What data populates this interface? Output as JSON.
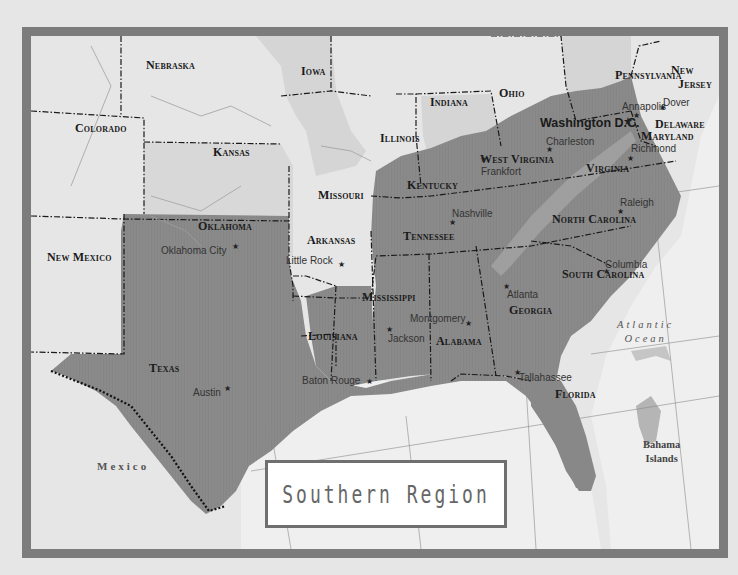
{
  "map": {
    "title": "Southern Region",
    "colors": {
      "frame": "#7c7c7c",
      "background": "#ececec",
      "non_region_state": "#e2e2e2",
      "northern_state_shade": "#d0d0d0",
      "southern_region": "#8a8a8a",
      "water": "#f2f2f2",
      "border": "#1a1a1a"
    },
    "states": [
      {
        "name": "Nebraska",
        "x": 115,
        "y": 23,
        "region": false
      },
      {
        "name": "Iowa",
        "x": 270,
        "y": 29,
        "region": false
      },
      {
        "name": "Colorado",
        "x": 44,
        "y": 86,
        "region": false
      },
      {
        "name": "Kansas",
        "x": 182,
        "y": 110,
        "region": false
      },
      {
        "name": "Missouri",
        "x": 287,
        "y": 153,
        "region": false
      },
      {
        "name": "Illinois",
        "x": 349,
        "y": 96,
        "region": false
      },
      {
        "name": "Indiana",
        "x": 399,
        "y": 60,
        "region": false
      },
      {
        "name": "Ohio",
        "x": 468,
        "y": 51,
        "region": false
      },
      {
        "name": "Pennsylvania",
        "x": 584,
        "y": 33,
        "region": false
      },
      {
        "name": "New",
        "x": 640,
        "y": 28,
        "region": false
      },
      {
        "name": "Jersey",
        "x": 647,
        "y": 42,
        "region": false
      },
      {
        "name": "New Mexico",
        "x": 16,
        "y": 215,
        "region": false
      },
      {
        "name": "Oklahoma",
        "x": 167,
        "y": 184,
        "region": true
      },
      {
        "name": "Arkansas",
        "x": 276,
        "y": 198,
        "region": true
      },
      {
        "name": "Texas",
        "x": 118,
        "y": 326,
        "region": true
      },
      {
        "name": "Louisiana",
        "x": 277,
        "y": 294,
        "region": true
      },
      {
        "name": "Mississippi",
        "x": 331,
        "y": 255,
        "region": true
      },
      {
        "name": "Alabama",
        "x": 405,
        "y": 299,
        "region": true
      },
      {
        "name": "Georgia",
        "x": 478,
        "y": 268,
        "region": true
      },
      {
        "name": "Florida",
        "x": 524,
        "y": 352,
        "region": true
      },
      {
        "name": "South Carolina",
        "x": 531,
        "y": 232,
        "region": true
      },
      {
        "name": "North Carolina",
        "x": 521,
        "y": 177,
        "region": true
      },
      {
        "name": "Tennessee",
        "x": 372,
        "y": 194,
        "region": true
      },
      {
        "name": "Kentucky",
        "x": 376,
        "y": 143,
        "region": true
      },
      {
        "name": "West Virginia",
        "x": 449,
        "y": 117,
        "region": true
      },
      {
        "name": "Virginia",
        "x": 555,
        "y": 126,
        "region": true
      },
      {
        "name": "Delaware",
        "x": 624,
        "y": 82,
        "region": true
      },
      {
        "name": "Maryland",
        "x": 610,
        "y": 94,
        "region": true
      }
    ],
    "capitals": [
      {
        "name": "Oklahoma City",
        "x": 130,
        "y": 210,
        "sx": 201,
        "sy": 207
      },
      {
        "name": "Little Rock",
        "x": 255,
        "y": 220,
        "sx": 307,
        "sy": 225
      },
      {
        "name": "Austin",
        "x": 162,
        "y": 352,
        "sx": 193,
        "sy": 349
      },
      {
        "name": "Baton Rouge",
        "x": 271,
        "y": 340,
        "sx": 335,
        "sy": 342
      },
      {
        "name": "Jackson",
        "x": 357,
        "y": 298,
        "sx": 355,
        "sy": 290
      },
      {
        "name": "Montgomery",
        "x": 379,
        "y": 278,
        "sx": 434,
        "sy": 284
      },
      {
        "name": "Atlanta",
        "x": 476,
        "y": 254,
        "sx": 472,
        "sy": 247
      },
      {
        "name": "Tallahassee",
        "x": 488,
        "y": 337,
        "sx": 483,
        "sy": 333
      },
      {
        "name": "Columbia",
        "x": 574,
        "y": 224,
        "sx": 572,
        "sy": 232
      },
      {
        "name": "Raleigh",
        "x": 589,
        "y": 162,
        "sx": 586,
        "sy": 172
      },
      {
        "name": "Nashville",
        "x": 421,
        "y": 173,
        "sx": 418,
        "sy": 183
      },
      {
        "name": "Frankfort",
        "x": 450,
        "y": 131,
        "sx": 449,
        "sy": 120
      },
      {
        "name": "Charleston",
        "x": 515,
        "y": 101,
        "sx": 515,
        "sy": 110
      },
      {
        "name": "Richmond",
        "x": 600,
        "y": 108,
        "sx": 596,
        "sy": 119
      },
      {
        "name": "Annapolis",
        "x": 591,
        "y": 66,
        "sx": 602,
        "sy": 76
      },
      {
        "name": "Dover",
        "x": 632,
        "y": 62,
        "sx": 628,
        "sy": 68
      }
    ],
    "national_capital": {
      "name": "Washington D.C.",
      "x": 509,
      "y": 81,
      "sx": 592,
      "sy": 80
    },
    "water_labels": {
      "ocean_line1": "Atlantic",
      "ocean_line2": "Ocean"
    },
    "countries": [
      {
        "name": "Mexico",
        "x": 66,
        "y": 424
      }
    ],
    "islands": {
      "line1": "Bahama",
      "line2": "Islands"
    }
  }
}
